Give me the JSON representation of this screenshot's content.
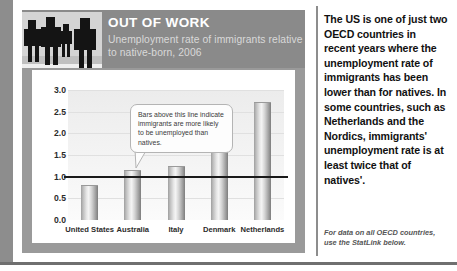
{
  "panel": {
    "header": {
      "title": "OUT OF WORK",
      "subtitle": "Unemployment rate of immigrants relative to native-born, 2006",
      "photo_alt": "people-silhouettes-photo"
    },
    "callout": "Bars above this line indicate immigrants are more likely to be unemployed than natives."
  },
  "sidebar": {
    "lede": "The US is one of just two OECD countries in recent years where the unemployment rate of immigrants has been lower than for natives. In some countries, such as Netherlands and the Nordics, immigrants' unemployment rate is at least twice that of natives'.",
    "footnote": "For data on all OECD countries, use the StatLink below."
  },
  "colors": {
    "frame": "#9a9a9a",
    "header_band": "#8a8a8a",
    "reference_line": "#1a1a1a",
    "bar_light": "#f4f4f4",
    "bar_dark": "#7d7d7d",
    "text": "#111111"
  },
  "chart_data": {
    "type": "bar",
    "title": "OUT OF WORK",
    "subtitle": "Unemployment rate of immigrants relative to native-born, 2006",
    "categories": [
      "United States",
      "Australia",
      "Italy",
      "Denmark",
      "Netherlands"
    ],
    "values": [
      0.78,
      1.12,
      1.22,
      2.0,
      2.7
    ],
    "xlabel": "",
    "ylabel": "",
    "ylim": [
      0.0,
      3.0
    ],
    "yticks": [
      "0.0",
      "0.5",
      "1.0",
      "1.5",
      "2.0",
      "2.5",
      "3.0"
    ],
    "ytick_values": [
      0.0,
      0.5,
      1.0,
      1.5,
      2.0,
      2.5,
      3.0
    ],
    "grid": true,
    "legend": "none",
    "reference_line": 1.0,
    "annotations": [
      "Bars above this line indicate immigrants are more likely to be unemployed than natives."
    ]
  }
}
